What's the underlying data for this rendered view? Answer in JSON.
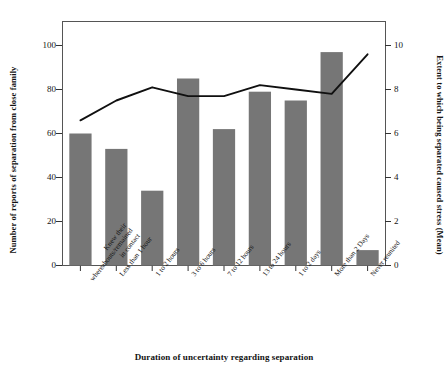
{
  "chart_data": {
    "type": "bar",
    "title": "",
    "xlabel": "Duration of uncertainty regarding separation",
    "ylabel": "Number of reports of separation from close family",
    "ylabel_secondary": "Extent to which being separated caused stress (Mean)",
    "categories": [
      "Knew their whereabouts/remained in contact",
      "Less than 1 hour",
      "1 to 2 hours",
      "3 to 6 hours",
      "7 to 12 hours",
      "13 to 24 hours",
      "1 to 2 days",
      "More than 2 Days",
      "Never reunited"
    ],
    "category_lines": [
      [
        "Knew their",
        "whereabouts/remained",
        "in contact"
      ],
      [
        "Less than 1 hour"
      ],
      [
        "1 to 2 hours"
      ],
      [
        "3 to 6 hours"
      ],
      [
        "7 to 12 hours"
      ],
      [
        "13 to 24 hours"
      ],
      [
        "1 to 2 days"
      ],
      [
        "More than 2 Days"
      ],
      [
        "Never reunited"
      ]
    ],
    "series": [
      {
        "name": "Number of reports of separation from close family",
        "type": "bar",
        "axis": "left",
        "color": "#767676",
        "values": [
          60,
          53,
          34,
          85,
          62,
          79,
          75,
          97,
          7
        ]
      },
      {
        "name": "Extent to which being separated caused stress (Mean)",
        "type": "line",
        "axis": "right",
        "color": "#101010",
        "values": [
          6.6,
          7.5,
          8.1,
          7.7,
          7.7,
          8.2,
          8.0,
          7.8,
          9.6
        ]
      }
    ],
    "ylim": [
      0,
      100
    ],
    "yticks": [
      0,
      20,
      40,
      60,
      80,
      100
    ],
    "ylim_secondary": [
      0,
      10
    ],
    "yticks_secondary": [
      0,
      2,
      4,
      6,
      8,
      10
    ],
    "grid": false,
    "legend": "none"
  }
}
